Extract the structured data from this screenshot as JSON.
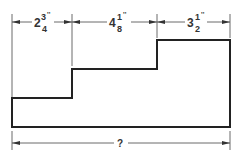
{
  "diagram": {
    "type": "stepped-profile-dimension-drawing",
    "top_dimensions": [
      {
        "whole": "2",
        "numerator": "3",
        "denominator": "4",
        "unit": "''"
      },
      {
        "whole": "4",
        "numerator": "1",
        "denominator": "8",
        "unit": "''"
      },
      {
        "whole": "3",
        "numerator": "1",
        "denominator": "2",
        "unit": "''"
      }
    ],
    "total_dimension": {
      "label": "?"
    }
  }
}
